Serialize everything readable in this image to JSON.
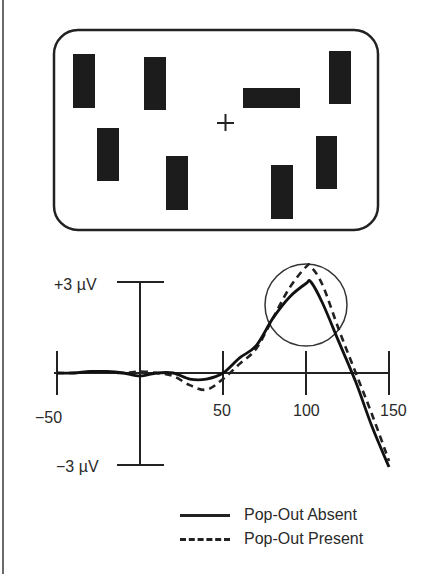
{
  "stimulus": {
    "fixation": "+",
    "bars": [
      {
        "orientation": "vertical",
        "x": 73,
        "y": 54,
        "w": 22,
        "h": 54
      },
      {
        "orientation": "vertical",
        "x": 144,
        "y": 57,
        "w": 22,
        "h": 53
      },
      {
        "orientation": "horizontal",
        "x": 243,
        "y": 88,
        "w": 57,
        "h": 20
      },
      {
        "orientation": "vertical",
        "x": 329,
        "y": 51,
        "w": 22,
        "h": 53
      },
      {
        "orientation": "vertical",
        "x": 97,
        "y": 128,
        "w": 22,
        "h": 53
      },
      {
        "orientation": "vertical",
        "x": 166,
        "y": 156,
        "w": 22,
        "h": 54
      },
      {
        "orientation": "vertical",
        "x": 271,
        "y": 165,
        "w": 22,
        "h": 54
      },
      {
        "orientation": "vertical",
        "x": 316,
        "y": 136,
        "w": 21,
        "h": 53
      }
    ]
  },
  "chart_data": {
    "type": "line",
    "title": "",
    "xlabel": "",
    "ylabel": "",
    "x_ticks": [
      "-50",
      "50",
      "100",
      "150"
    ],
    "y_ticks": [
      "+3 µV",
      "-3 µV"
    ],
    "xlim": [
      -50,
      150
    ],
    "ylim": [
      -3,
      3
    ],
    "grid": false,
    "legend_position": "bottom-right",
    "annotations": [
      "circle highlighting peak near 100 ms"
    ],
    "x": [
      -50,
      -40,
      -30,
      -20,
      -10,
      0,
      10,
      20,
      30,
      40,
      50,
      60,
      70,
      80,
      90,
      100,
      103,
      110,
      120,
      130,
      140,
      150
    ],
    "series": [
      {
        "name": "Pop-Out Absent",
        "style": "solid",
        "values": [
          0,
          0,
          0.05,
          0.05,
          0,
          -0.1,
          0,
          0,
          -0.2,
          -0.2,
          0,
          0.5,
          0.9,
          1.8,
          2.5,
          2.95,
          3.0,
          2.3,
          1.0,
          -0.3,
          -1.8,
          -3.1
        ]
      },
      {
        "name": "Pop-Out Present",
        "style": "dashed",
        "values": [
          0,
          0,
          0.02,
          0.02,
          0,
          0.05,
          0,
          -0.1,
          -0.4,
          -0.55,
          -0.2,
          0.3,
          0.8,
          1.8,
          2.8,
          3.5,
          3.5,
          2.9,
          1.4,
          0,
          -1.4,
          -2.9
        ]
      }
    ]
  },
  "axes": {
    "y_top_label": "+3 µV",
    "y_bottom_label": "−3 µV",
    "x_labels": {
      "m50": "−50",
      "p50": "50",
      "p100": "100",
      "p150": "150"
    }
  },
  "legend": {
    "absent": "Pop-Out Absent",
    "present": "Pop-Out Present"
  }
}
